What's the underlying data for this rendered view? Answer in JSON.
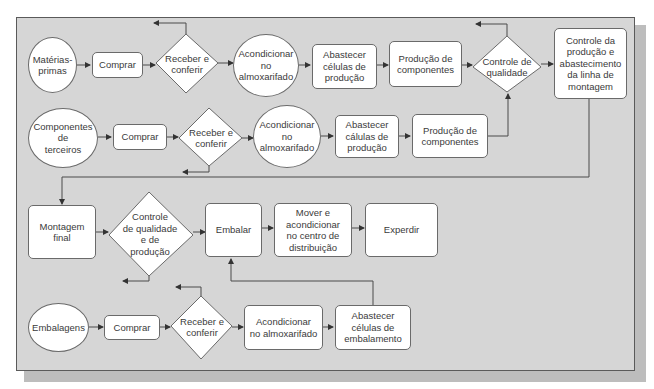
{
  "diagram": {
    "nodes": [
      {
        "id": "materias-primas",
        "shape": "ellipse",
        "label": "Matérias-\nprimas"
      },
      {
        "id": "comprar-1",
        "shape": "rect",
        "label": "Comprar"
      },
      {
        "id": "receber-1",
        "shape": "diamond",
        "label": "Receber e\nconferir"
      },
      {
        "id": "acondicionar-1",
        "shape": "ellipse",
        "label": "Acondicionar\nno\nalmoxarifado"
      },
      {
        "id": "abastecer-1",
        "shape": "rect",
        "label": "Abastecer\ncélulas de\nprodução"
      },
      {
        "id": "producao-1",
        "shape": "rect",
        "label": "Produção de\ncomponentes"
      },
      {
        "id": "controle-qualidade",
        "shape": "diamond",
        "label": "Controle de\nqualidade"
      },
      {
        "id": "controle-producao",
        "shape": "rect",
        "label": "Controle da\nprodução e\nabastecimento\nda linha de\nmontagem"
      },
      {
        "id": "componentes-terceiros",
        "shape": "ellipse",
        "label": "Componentes\nde\nterceiros"
      },
      {
        "id": "comprar-2",
        "shape": "rect",
        "label": "Comprar"
      },
      {
        "id": "receber-2",
        "shape": "diamond",
        "label": "Receber e\nconferir"
      },
      {
        "id": "acondicionar-2",
        "shape": "ellipse",
        "label": "Acondicionar\nno\nalmoxarifado"
      },
      {
        "id": "abastecer-2",
        "shape": "rect",
        "label": "Abastecer\ncálulas de\nprodução"
      },
      {
        "id": "producao-2",
        "shape": "rect",
        "label": "Produção de\ncomponentes"
      },
      {
        "id": "montagem-final",
        "shape": "rect",
        "label": "Montagem\nfinal"
      },
      {
        "id": "controle-qualidade-producao",
        "shape": "diamond",
        "label": "Controle\nde qualidade\ne de\nprodução"
      },
      {
        "id": "embalar",
        "shape": "rect",
        "label": "Embalar"
      },
      {
        "id": "mover",
        "shape": "rect",
        "label": "Mover e\nacondicionar\nno centro de\ndistribuição"
      },
      {
        "id": "expedir",
        "shape": "rect",
        "label": "Experdir"
      },
      {
        "id": "embalagens",
        "shape": "ellipse",
        "label": "Embalagens"
      },
      {
        "id": "comprar-3",
        "shape": "rect",
        "label": "Comprar"
      },
      {
        "id": "receber-3",
        "shape": "diamond",
        "label": "Receber e\nconferir"
      },
      {
        "id": "acondicionar-3",
        "shape": "rect",
        "label": "Acondicionar\nno almoxarifado"
      },
      {
        "id": "abastecer-3",
        "shape": "rect",
        "label": "Abastecer\ncélulas de\nembalamento"
      }
    ],
    "colors": {
      "panel": "#d6d6d6",
      "node_fill": "#ffffff",
      "stroke": "#4a4a4a",
      "text": "#3a3a3a"
    }
  }
}
